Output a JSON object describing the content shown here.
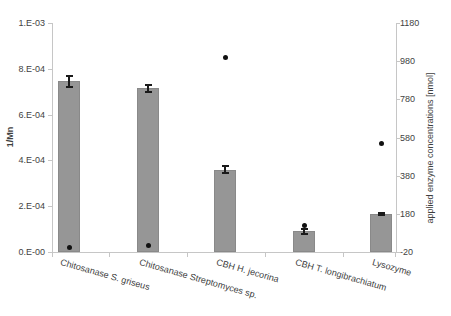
{
  "chart_data": {
    "type": "bar",
    "title": "",
    "xlabel": "",
    "categories": [
      "Chitosanase S. griseus",
      "Chitosanase Streptomyces sp.",
      "CBH H. jecorina",
      "CBH T. longibrachiatum",
      "Lysozyme"
    ],
    "series": [
      {
        "name": "1/Mn",
        "type": "bar",
        "axis": "left",
        "values": [
          0.000745,
          0.000715,
          0.00036,
          9e-05,
          0.000165
        ],
        "errors": [
          2.5e-05,
          1.5e-05,
          1.5e-05,
          1e-05,
          5e-06
        ],
        "color": "#969696"
      },
      {
        "name": "applied enzyme concentrations [nmol]",
        "type": "scatter",
        "axis": "right",
        "values": [
          5,
          15,
          1000,
          120,
          550
        ],
        "color": "#111111"
      }
    ],
    "left_axis": {
      "label": "1/Mn",
      "min": 0,
      "max": 0.001,
      "tick_labels": [
        "1.E-03",
        "8.E-04",
        "6.E-04",
        "4.E-04",
        "2.E-04",
        "0.E-00"
      ]
    },
    "right_axis": {
      "label": "applied enzyme concentrations [nmol]",
      "min": -20,
      "max": 1180,
      "tick_labels": [
        "1180",
        "980",
        "780",
        "580",
        "380",
        "180",
        "-20"
      ]
    },
    "grid": "off",
    "legend": "none",
    "colors": {
      "bar_fill": "#969696",
      "dot": "#111111",
      "axis_line": "#c6c6c6",
      "text": "#3f3f3f"
    }
  }
}
